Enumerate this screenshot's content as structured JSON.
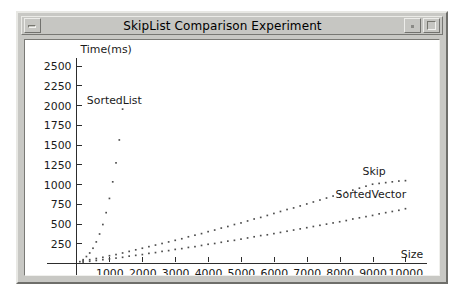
{
  "window": {
    "title": "SkipList Comparison Experiment",
    "buttons": {
      "minimize": "minimize",
      "shade": "shade",
      "maximize": "maximize"
    }
  },
  "chart_data": {
    "type": "scatter",
    "title": "SkipList Comparison Experiment",
    "xlabel": "Size",
    "ylabel": "Time(ms)",
    "xlim": [
      0,
      10600
    ],
    "ylim": [
      0,
      2600
    ],
    "grid": false,
    "legend_position": "inline-annotations",
    "xticks": [
      1000,
      2000,
      3000,
      4000,
      5000,
      6000,
      7000,
      8000,
      9000,
      10000
    ],
    "yticks": [
      250,
      500,
      750,
      1000,
      1250,
      1500,
      1750,
      2000,
      2250,
      2500
    ],
    "series": [
      {
        "name": "SortedList",
        "label_x": 1150,
        "label_y": 2020,
        "x": [
          100,
          200,
          300,
          400,
          500,
          600,
          700,
          800,
          900,
          1000,
          1100,
          1200,
          1300,
          1400
        ],
        "y": [
          20,
          45,
          85,
          130,
          190,
          270,
          370,
          490,
          640,
          820,
          1030,
          1270,
          1560,
          1950
        ]
      },
      {
        "name": "Skip",
        "label_x": 9050,
        "label_y": 1110,
        "x": [
          200,
          400,
          600,
          800,
          1000,
          1200,
          1400,
          1600,
          1800,
          2000,
          2200,
          2400,
          2600,
          2800,
          3000,
          3200,
          3400,
          3600,
          3800,
          4000,
          4200,
          4400,
          4600,
          4800,
          5000,
          5200,
          5400,
          5600,
          5800,
          6000,
          6200,
          6400,
          6600,
          6800,
          7000,
          7200,
          7400,
          7600,
          7800,
          8000,
          8200,
          8400,
          8600,
          8800,
          9000,
          9200,
          9400,
          9600,
          9800,
          10000
        ],
        "y": [
          30,
          45,
          60,
          75,
          95,
          110,
          130,
          150,
          170,
          190,
          210,
          230,
          250,
          270,
          290,
          310,
          335,
          355,
          375,
          400,
          420,
          445,
          465,
          490,
          510,
          535,
          560,
          580,
          605,
          630,
          655,
          680,
          700,
          725,
          750,
          775,
          800,
          825,
          850,
          875,
          900,
          925,
          950,
          975,
          1000,
          1010,
          1020,
          1030,
          1040,
          1045
        ]
      },
      {
        "name": "SortedVector",
        "label_x": 8950,
        "label_y": 820,
        "x": [
          200,
          400,
          600,
          800,
          1000,
          1200,
          1400,
          1600,
          1800,
          2000,
          2200,
          2400,
          2600,
          2800,
          3000,
          3200,
          3400,
          3600,
          3800,
          4000,
          4200,
          4400,
          4600,
          4800,
          5000,
          5200,
          5400,
          5600,
          5800,
          6000,
          6200,
          6400,
          6600,
          6800,
          7000,
          7200,
          7400,
          7600,
          7800,
          8000,
          8200,
          8400,
          8600,
          8800,
          9000,
          9200,
          9400,
          9600,
          9800,
          10000
        ],
        "y": [
          15,
          25,
          35,
          45,
          55,
          65,
          75,
          90,
          100,
          110,
          125,
          135,
          150,
          160,
          175,
          185,
          200,
          210,
          225,
          240,
          250,
          265,
          280,
          290,
          305,
          320,
          335,
          350,
          360,
          375,
          390,
          405,
          420,
          435,
          450,
          465,
          480,
          495,
          510,
          525,
          540,
          560,
          575,
          590,
          605,
          625,
          640,
          655,
          670,
          690
        ]
      }
    ]
  }
}
